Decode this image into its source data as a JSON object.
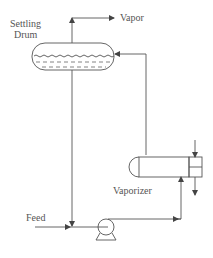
{
  "diagram": {
    "type": "process-flow",
    "labels": {
      "settling_drum_line1": "Settling",
      "settling_drum_line2": "Drum",
      "vapor": "Vapor",
      "vaporizer": "Vaporizer",
      "feed": "Feed"
    },
    "colors": {
      "line": "#555555",
      "text": "#555555",
      "background": "#ffffff"
    }
  }
}
